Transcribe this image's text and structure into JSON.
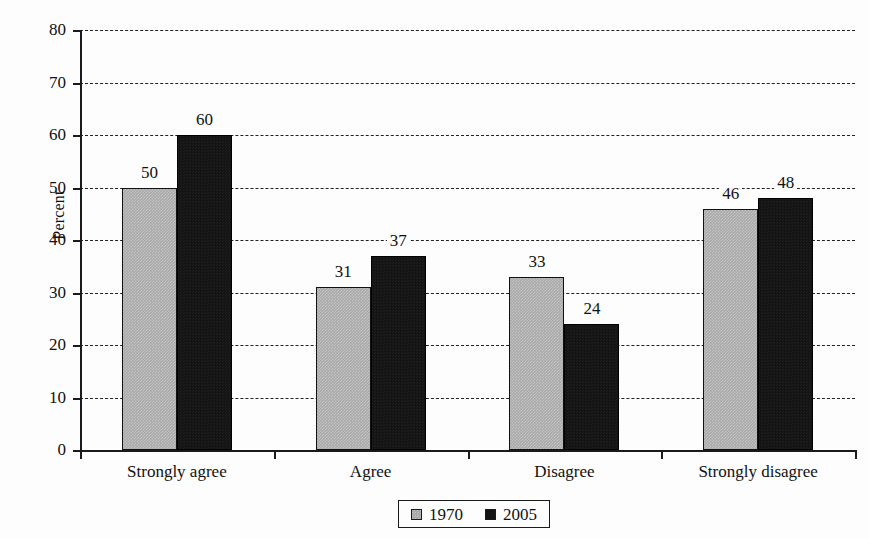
{
  "chart_data": {
    "type": "bar",
    "title": "",
    "subtitle": "",
    "xlabel": "",
    "ylabel": "Percent",
    "ylim": [
      0,
      80
    ],
    "ytick_step": 10,
    "yticks": [
      80,
      70,
      60,
      50,
      40,
      30,
      20,
      10,
      0
    ],
    "grid": true,
    "grid_style": "dashed-horizontal",
    "legend_position": "bottom-center",
    "categories": [
      "Strongly agree",
      "Agree",
      "Disagree",
      "Strongly disagree"
    ],
    "series": [
      {
        "name": "1970",
        "color": "#a9a9a9",
        "values": [
          50,
          31,
          33,
          46
        ]
      },
      {
        "name": "2005",
        "color": "#141414",
        "values": [
          60,
          37,
          24,
          48
        ]
      }
    ],
    "data_labels": [
      [
        "50",
        "60"
      ],
      [
        "31",
        "37"
      ],
      [
        "33",
        "24"
      ],
      [
        "46",
        "48"
      ]
    ]
  },
  "legend": {
    "entries": [
      {
        "label": "1970",
        "swatch": "gray-swatch-icon"
      },
      {
        "label": "2005",
        "swatch": "black-swatch-icon"
      }
    ]
  }
}
